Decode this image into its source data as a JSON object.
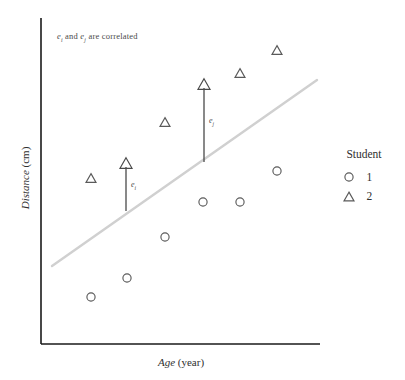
{
  "chart_data": {
    "type": "scatter",
    "title": "",
    "xlabel_italic": "Age",
    "xlabel_rest": " (year)",
    "ylabel_italic": "Distance",
    "ylabel_rest": " (cm)",
    "grid": false,
    "axis_ranges": {
      "x_pixels": [
        41,
        320
      ],
      "y_pixels": [
        18,
        344
      ]
    },
    "annotation": {
      "text_part1": "e",
      "sub1": "i",
      "text_part2": " and ",
      "text_part3": "e",
      "sub2": "j",
      "text_part4": " are correlated",
      "x": 57,
      "y": 31
    },
    "fit_line": {
      "label": "regression-line",
      "color": "#d0d0d0",
      "x1": 52,
      "y1": 266,
      "x2": 317,
      "y2": 80,
      "width": 2.4
    },
    "series": [
      {
        "name": "1",
        "marker": "circle",
        "color": "#5a5a5a",
        "points": [
          {
            "x": 91,
            "y": 297
          },
          {
            "x": 127,
            "y": 278
          },
          {
            "x": 165,
            "y": 237
          },
          {
            "x": 203,
            "y": 202
          },
          {
            "x": 240,
            "y": 202
          },
          {
            "x": 277,
            "y": 171
          }
        ]
      },
      {
        "name": "2",
        "marker": "triangle",
        "color": "#5a5a5a",
        "points": [
          {
            "x": 91,
            "y": 178
          },
          {
            "x": 165,
            "y": 122
          },
          {
            "x": 240,
            "y": 73
          },
          {
            "x": 277,
            "y": 50
          }
        ]
      }
    ],
    "residual_arrows": [
      {
        "name": "e-i",
        "label": "e",
        "sub": "i",
        "x": 126,
        "y_base": 211,
        "y_tip": 163,
        "label_x": 131,
        "label_y": 180,
        "color": "#4a4a4a"
      },
      {
        "name": "e-j",
        "label": "e",
        "sub": "j",
        "x": 204,
        "y_base": 162,
        "y_tip": 84,
        "label_x": 209,
        "label_y": 116,
        "color": "#4a4a4a"
      }
    ],
    "axes": {
      "color": "#1a1a1a",
      "x_axis": {
        "x1": 41,
        "y1": 344,
        "x2": 320,
        "y2": 344
      },
      "y_axis": {
        "x1": 41,
        "y1": 18,
        "x2": 41,
        "y2": 344
      }
    }
  },
  "legend": {
    "title": "Student",
    "entries": [
      {
        "marker": "circle",
        "label": "1"
      },
      {
        "marker": "triangle",
        "label": "2"
      }
    ]
  }
}
